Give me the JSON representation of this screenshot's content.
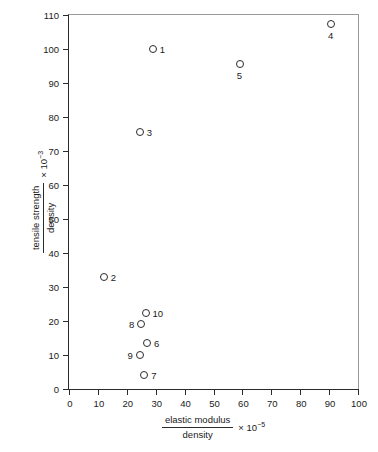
{
  "chart_data": {
    "type": "scatter",
    "title": "",
    "xlabel_numerator": "elastic modulus",
    "xlabel_denominator": "density",
    "xlabel_multiplier": "× 10",
    "xlabel_exponent": "−5",
    "ylabel_numerator": "tensile strength",
    "ylabel_denominator": "density",
    "ylabel_multiplier": "× 10",
    "ylabel_exponent": "−3",
    "xlim": [
      0,
      100
    ],
    "ylim": [
      0,
      110
    ],
    "xticks": [
      0,
      10,
      20,
      30,
      40,
      50,
      60,
      70,
      80,
      90,
      100
    ],
    "yticks": [
      0,
      10,
      20,
      30,
      40,
      50,
      60,
      70,
      80,
      90,
      100,
      110
    ],
    "xtick_labels": [
      "0",
      "10",
      "20",
      "30",
      "40",
      "50",
      "60",
      "70",
      "80",
      "90",
      "100"
    ],
    "ytick_labels": [
      "0",
      "10",
      "20",
      "30",
      "40",
      "50",
      "60",
      "70",
      "80",
      "90",
      "100",
      "110"
    ],
    "grid": false,
    "legend": false,
    "marker": "open-circle",
    "marker_color": "#2b2b2b",
    "points": [
      {
        "label": "1",
        "x": 29.0,
        "y": 100.0,
        "label_pos": "right"
      },
      {
        "label": "2",
        "x": 12.0,
        "y": 33.0,
        "label_pos": "right"
      },
      {
        "label": "3",
        "x": 24.5,
        "y": 75.5,
        "label_pos": "right"
      },
      {
        "label": "4",
        "x": 90.5,
        "y": 107.5,
        "label_pos": "below"
      },
      {
        "label": "5",
        "x": 59.0,
        "y": 95.5,
        "label_pos": "below"
      },
      {
        "label": "6",
        "x": 27.0,
        "y": 13.5,
        "label_pos": "right"
      },
      {
        "label": "7",
        "x": 26.0,
        "y": 4.0,
        "label_pos": "right"
      },
      {
        "label": "8",
        "x": 25.0,
        "y": 19.0,
        "label_pos": "left"
      },
      {
        "label": "9",
        "x": 24.5,
        "y": 10.0,
        "label_pos": "left"
      },
      {
        "label": "10",
        "x": 26.5,
        "y": 22.5,
        "label_pos": "right"
      }
    ]
  }
}
